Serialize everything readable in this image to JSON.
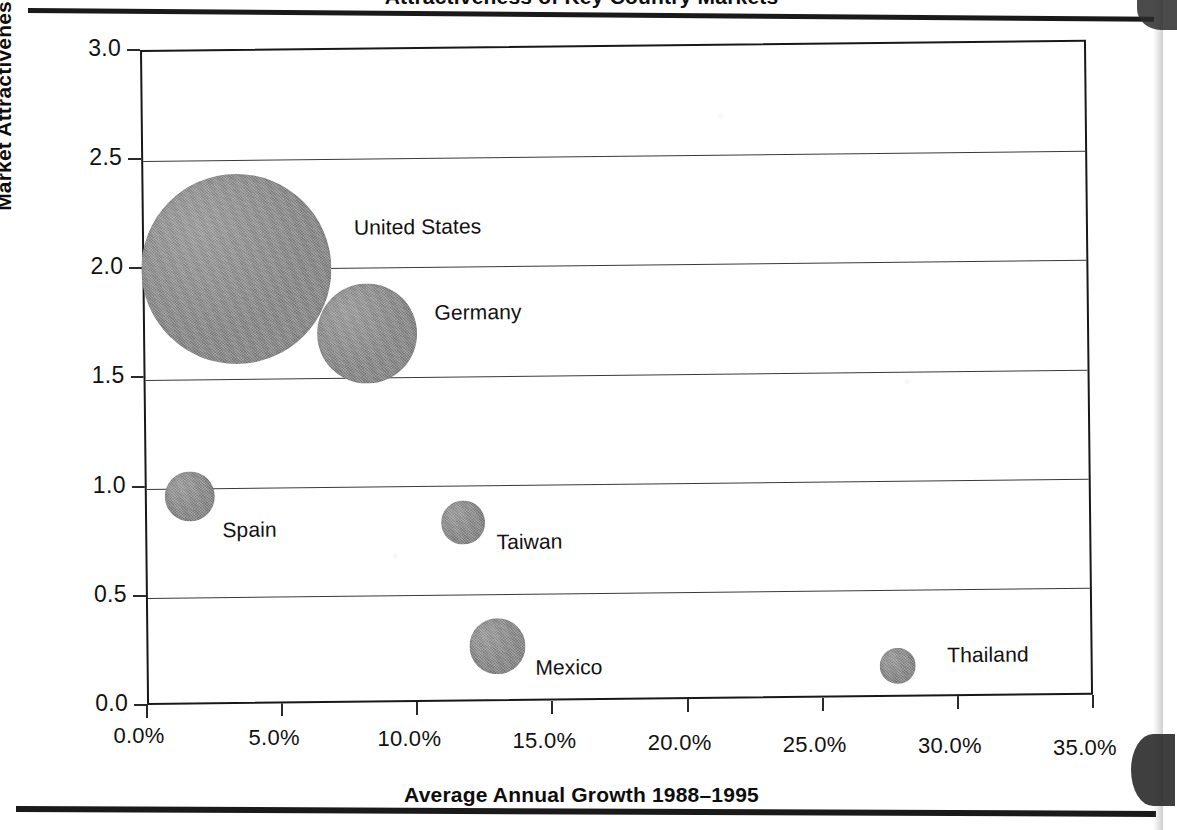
{
  "chart_data": {
    "type": "scatter",
    "title": "Attractiveness of Key Country Markets",
    "title_note": "cropped at top edge of page",
    "xlabel": "Average Annual Growth 1988–1995",
    "ylabel": "Market Attractiveness",
    "xlim": [
      0,
      35
    ],
    "ylim": [
      0,
      3.0
    ],
    "xtick_labels": [
      "0.0%",
      "5.0%",
      "10.0%",
      "15.0%",
      "20.0%",
      "25.0%",
      "30.0%",
      "35.0%"
    ],
    "xtick_values": [
      0,
      5,
      10,
      15,
      20,
      25,
      30,
      35
    ],
    "ytick_labels": [
      "0.0",
      "0.5",
      "1.0",
      "1.5",
      "2.0",
      "2.5",
      "3.0"
    ],
    "ytick_values": [
      0.0,
      0.5,
      1.0,
      1.5,
      2.0,
      2.5,
      3.0
    ],
    "grid": "horizontal",
    "legend": "none",
    "bubble_color": "#8b8b8b",
    "points": [
      {
        "label": "United States",
        "x": 3.4,
        "y": 2.0,
        "r_px": 95,
        "label_dx": 118,
        "label_dy": -52
      },
      {
        "label": "Germany",
        "x": 8.2,
        "y": 1.7,
        "r_px": 50,
        "label_dx": 68,
        "label_dy": -32
      },
      {
        "label": "Spain",
        "x": 1.6,
        "y": 0.96,
        "r_px": 25,
        "label_dx": 32,
        "label_dy": 22
      },
      {
        "label": "Taiwan",
        "x": 11.7,
        "y": 0.83,
        "r_px": 22,
        "label_dx": 33,
        "label_dy": 8
      },
      {
        "label": "Mexico",
        "x": 12.9,
        "y": 0.26,
        "r_px": 28,
        "label_dx": 38,
        "label_dy": 10
      },
      {
        "label": "Thailand",
        "x": 27.7,
        "y": 0.15,
        "r_px": 18,
        "label_dx": 50,
        "label_dy": -22
      }
    ]
  },
  "axes": {
    "y_title": "Market Attractiveness",
    "x_title": "Average Annual Growth 1988–1995"
  }
}
